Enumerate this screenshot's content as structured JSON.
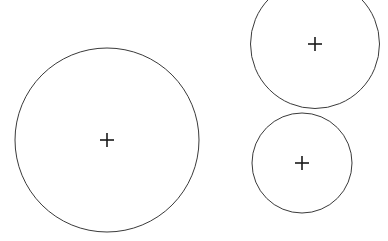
{
  "figure": {
    "background_color": "#ffffff",
    "width": 388,
    "height": 241,
    "stroke_color": "#3a3a3a",
    "marker_color": "#1a1a1a",
    "stroke_width": 1,
    "marker_stroke_width": 1.6,
    "marker_arm_length": 7
  },
  "chart_data": {
    "type": "scatter",
    "subtitle": "",
    "xlabel": "",
    "ylabel": "",
    "xlim": [
      0,
      388
    ],
    "ylim": [
      241,
      0
    ],
    "grid": false,
    "legend": false,
    "legend_position": "none",
    "units": "pixels",
    "annotations": [],
    "series": [
      {
        "name": "circle-centers",
        "marker": "plus",
        "x": [
          107,
          315,
          302
        ],
        "y": [
          140,
          44,
          163
        ]
      }
    ],
    "circles": [
      {
        "id": "circle-large-left",
        "label": "Large left circle",
        "cx": 107,
        "cy": 140,
        "r": 92,
        "diameter": 184,
        "clipped": false,
        "color": "#3a3a3a"
      },
      {
        "id": "circle-top-right",
        "label": "Top right circle",
        "cx": 315,
        "cy": 44,
        "r": 64.5,
        "diameter": 129,
        "clipped": true,
        "color": "#3a3a3a"
      },
      {
        "id": "circle-bottom-right",
        "label": "Bottom right circle",
        "cx": 302,
        "cy": 163,
        "r": 50,
        "diameter": 100,
        "clipped": false,
        "color": "#3a3a3a"
      }
    ]
  }
}
